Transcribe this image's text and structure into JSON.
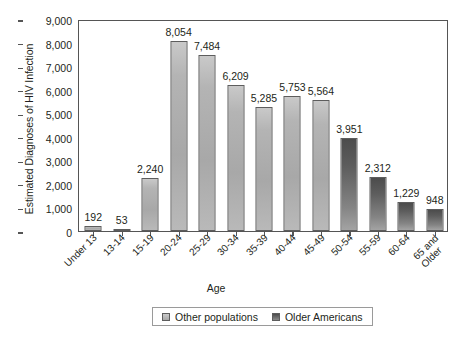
{
  "chart_data": {
    "type": "bar",
    "title": "",
    "xlabel": "Age",
    "ylabel": "Estimated Diagnoses of HIV Infection",
    "ylim": [
      0,
      9000
    ],
    "ytick_labels": [
      "9,000",
      "8,000",
      "7,000",
      "6,000",
      "5,000",
      "4,000",
      "3,000",
      "2,000",
      "1,000",
      "0"
    ],
    "ytick_values": [
      9000,
      8000,
      7000,
      6000,
      5000,
      4000,
      3000,
      2000,
      1000,
      0
    ],
    "grid": false,
    "legend_position": "bottom-center",
    "categories": [
      "Under 13",
      "13-14",
      "15-19",
      "20-24",
      "25-29",
      "30-34",
      "35-39",
      "40-44",
      "45-49",
      "50-54",
      "55-59",
      "60-64",
      "65 and Older"
    ],
    "category_lines": [
      [
        "Under 13"
      ],
      [
        "13-14"
      ],
      [
        "15-19"
      ],
      [
        "20-24"
      ],
      [
        "25-29"
      ],
      [
        "30-34"
      ],
      [
        "35-39"
      ],
      [
        "40-44"
      ],
      [
        "45-49"
      ],
      [
        "50-54"
      ],
      [
        "55-59"
      ],
      [
        "60-64"
      ],
      [
        "65 and",
        "Older"
      ]
    ],
    "values": [
      192,
      53,
      2240,
      8054,
      7484,
      6209,
      5285,
      5753,
      5564,
      3951,
      2312,
      1229,
      948
    ],
    "value_labels": [
      "192",
      "53",
      "2,240",
      "8,054",
      "7,484",
      "6,209",
      "5,285",
      "5,753",
      "5,564",
      "3,951",
      "2,312",
      "1,229",
      "948"
    ],
    "series_of_bar": [
      "other",
      "other",
      "other",
      "other",
      "other",
      "other",
      "other",
      "other",
      "other",
      "older",
      "older",
      "older",
      "older"
    ],
    "legend": [
      {
        "key": "other",
        "label": "Other populations",
        "color": "#b4b4b4"
      },
      {
        "key": "older",
        "label": "Older Americans",
        "color": "#585858"
      }
    ]
  }
}
